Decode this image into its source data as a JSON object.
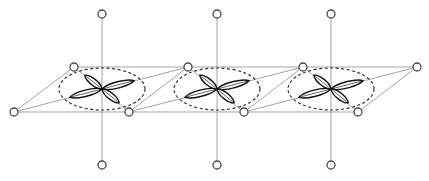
{
  "diagram": {
    "colors": {
      "background": "#ffffff",
      "bond_line": "#9a9a9a",
      "atom_outline": "#4a4a4a",
      "lobe_outline": "#111111",
      "envelope_dashed": "#333333"
    },
    "plane": {
      "top_edge": {
        "x1": 74,
        "y1": 67,
        "x2": 417,
        "y2": 67
      },
      "bottom_edge": {
        "x1": 14,
        "y1": 112,
        "x2": 358,
        "y2": 112
      }
    },
    "units": [
      {
        "center": {
          "x": 102,
          "y": 89
        },
        "apical_top": {
          "x": 102,
          "y": 14
        },
        "apical_bottom": {
          "x": 102,
          "y": 165
        },
        "plane_upper_atom": {
          "x": 74,
          "y": 67
        },
        "plane_lower_atom": {
          "x": 14,
          "y": 112
        },
        "long_axis_ends": [
          {
            "x": 14,
            "y": 112
          },
          {
            "x": 188,
            "y": 67
          }
        ],
        "short_axis_ends": [
          {
            "x": 74,
            "y": 67
          },
          {
            "x": 129,
            "y": 112
          }
        ],
        "envelope": {
          "rx": 43,
          "ry": 21
        }
      },
      {
        "center": {
          "x": 217,
          "y": 89
        },
        "apical_top": {
          "x": 217,
          "y": 14
        },
        "apical_bottom": {
          "x": 217,
          "y": 165
        },
        "plane_upper_atom": {
          "x": 188,
          "y": 67
        },
        "plane_lower_atom": {
          "x": 129,
          "y": 112
        },
        "long_axis_ends": [
          {
            "x": 129,
            "y": 112
          },
          {
            "x": 303,
            "y": 67
          }
        ],
        "short_axis_ends": [
          {
            "x": 188,
            "y": 67
          },
          {
            "x": 244,
            "y": 112
          }
        ],
        "envelope": {
          "rx": 43,
          "ry": 21
        }
      },
      {
        "center": {
          "x": 331,
          "y": 89
        },
        "apical_top": {
          "x": 331,
          "y": 14
        },
        "apical_bottom": {
          "x": 331,
          "y": 165
        },
        "plane_upper_atom": {
          "x": 303,
          "y": 67
        },
        "plane_lower_atom": {
          "x": 244,
          "y": 112
        },
        "long_axis_ends": [
          {
            "x": 244,
            "y": 112
          },
          {
            "x": 417,
            "y": 67
          }
        ],
        "short_axis_ends": [
          {
            "x": 303,
            "y": 67
          },
          {
            "x": 358,
            "y": 112
          }
        ],
        "envelope": {
          "rx": 43,
          "ry": 21
        }
      }
    ],
    "end_atoms": [
      {
        "x": 417,
        "y": 67
      },
      {
        "x": 358,
        "y": 112
      }
    ],
    "lobes": {
      "long_length": 33,
      "long_width": 6,
      "short_length": 22,
      "short_width": 6,
      "long_angle_deg": -14.5,
      "short_angle_deg": 39
    },
    "atom_radius": 4
  }
}
